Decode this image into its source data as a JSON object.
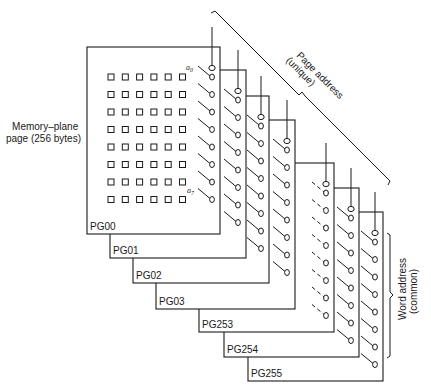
{
  "diagram": {
    "type": "memory-plane-stack",
    "colors": {
      "ink": "#1a1a1a",
      "background": "#ffffff"
    },
    "left_label": {
      "line1": "Memory–plane",
      "line2": "page (256 bytes)"
    },
    "page_address_label": {
      "line1": "Page address",
      "line2": "(unique)"
    },
    "word_address_label": {
      "line1": "Word address",
      "line2": "(common)"
    },
    "bit_labels": {
      "first": "a0",
      "first_base": "a",
      "first_sub": "0",
      "last_base": "a",
      "last_sub": "7"
    },
    "cell_grid": {
      "rows": 8,
      "cols": 6
    },
    "planes": [
      {
        "label": "PG00",
        "x": 87,
        "y": 47,
        "w": 133,
        "h": 187,
        "dashed": false
      },
      {
        "label": "PG01",
        "x": 110,
        "y": 70,
        "w": 136,
        "h": 188,
        "dashed": false
      },
      {
        "label": "PG02",
        "x": 133,
        "y": 96,
        "w": 136,
        "h": 187,
        "dashed": false
      },
      {
        "label": "PG03",
        "x": 156,
        "y": 120,
        "w": 139,
        "h": 189,
        "dashed": false
      },
      {
        "label": "PG253",
        "x": 199,
        "y": 163,
        "w": 135,
        "h": 169,
        "dashed": true
      },
      {
        "label": "PG254",
        "x": 224,
        "y": 188,
        "w": 135,
        "h": 169,
        "dashed": false
      },
      {
        "label": "PG255",
        "x": 248,
        "y": 212,
        "w": 135,
        "h": 169,
        "dashed": false
      }
    ]
  }
}
